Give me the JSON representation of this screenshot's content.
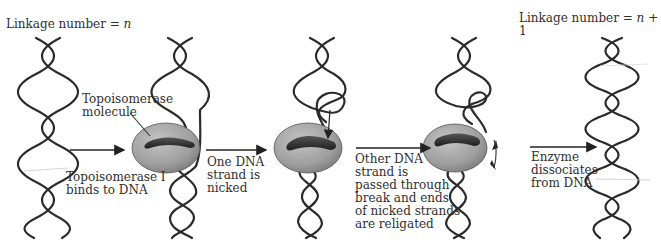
{
  "diagram": {
    "title_left": {
      "text": "Linkage number = ",
      "var": "n"
    },
    "title_right": {
      "text": "Linkage number = ",
      "var": "n",
      "suffix": " + 1"
    },
    "labels": {
      "enzyme": "Topoisomerase\nmolecule",
      "step1": "Topoisomerase I\nbinds to DNA",
      "step2": "One DNA\nstrand is\nnicked",
      "step3": "Other DNA\nstrand is\npassed through\nbreak and ends\nof nicked strands\nare religated",
      "step4": "Enzyme\ndissociates\nfrom DNA"
    },
    "stages": [
      {
        "id": "relaxed-dna",
        "description": "Double helix, linkage number n"
      },
      {
        "id": "enzyme-bound",
        "description": "Topoisomerase I bound to DNA"
      },
      {
        "id": "strand-nicked",
        "description": "One strand nicked"
      },
      {
        "id": "strand-passed",
        "description": "Other strand passed through, ends religated"
      },
      {
        "id": "released-dna",
        "description": "Double helix, linkage number n + 1"
      }
    ],
    "colors": {
      "strand": "#2b2b2b",
      "enzyme_fill": "#a9a9a9",
      "enzyme_groove": "#3a3a3a",
      "text": "#2f2f2f"
    }
  }
}
